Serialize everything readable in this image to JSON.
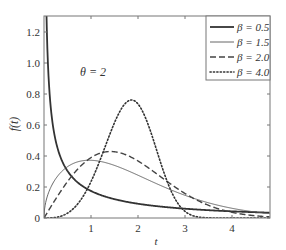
{
  "chart_data": {
    "type": "line",
    "title": "",
    "annotation": "θ = 2",
    "xlabel": "t",
    "ylabel": "f(t)",
    "xlim": [
      0,
      4.8
    ],
    "ylim": [
      0,
      1.3
    ],
    "xticks": [
      1,
      2,
      3,
      4
    ],
    "yticks": [
      0,
      0.2,
      0.4,
      0.6,
      0.8,
      1.0,
      1.2
    ],
    "ytick_labels": [
      "0",
      "0.2",
      "0.4",
      "0.6",
      "0.8",
      "1.0",
      "1.2"
    ],
    "xtick_labels": [
      "1",
      "2",
      "3",
      "4"
    ],
    "grid": false,
    "legend_position": "upper right",
    "theta": 2,
    "series": [
      {
        "name": "β = 0.5",
        "beta": 0.5,
        "style": "solid-thick",
        "x": [
          0.05,
          0.1,
          0.2,
          0.5,
          1.0,
          1.5,
          2.0,
          3.0,
          4.0,
          4.8
        ],
        "values": [
          1.28,
          0.89,
          0.63,
          0.36,
          0.22,
          0.15,
          0.11,
          0.07,
          0.04,
          0.03
        ]
      },
      {
        "name": "β = 1.5",
        "beta": 1.5,
        "style": "solid-thin",
        "x": [
          0,
          0.25,
          0.5,
          1.0,
          1.5,
          2.0,
          2.5,
          3.0,
          4.0,
          4.8
        ],
        "values": [
          0,
          0.23,
          0.33,
          0.37,
          0.35,
          0.28,
          0.22,
          0.16,
          0.07,
          0.03
        ]
      },
      {
        "name": "β = 2.0",
        "beta": 2.0,
        "style": "dashed",
        "x": [
          0,
          0.5,
          1.0,
          1.41,
          2.0,
          2.5,
          3.0,
          4.0,
          4.8
        ],
        "values": [
          0,
          0.24,
          0.39,
          0.43,
          0.37,
          0.26,
          0.16,
          0.04,
          0.01
        ]
      },
      {
        "name": "β = 4.0",
        "beta": 4.0,
        "style": "dotted",
        "x": [
          0,
          0.5,
          1.0,
          1.5,
          1.86,
          2.0,
          2.5,
          3.0,
          3.5,
          4.0
        ],
        "values": [
          0,
          0.03,
          0.23,
          0.62,
          0.77,
          0.74,
          0.32,
          0.03,
          0.0,
          0.0
        ]
      }
    ]
  }
}
